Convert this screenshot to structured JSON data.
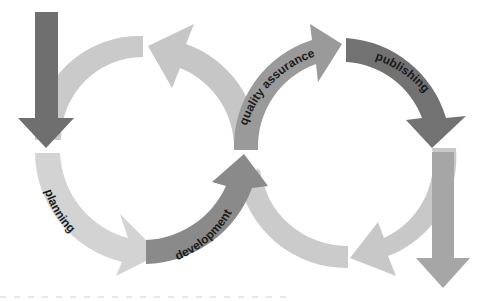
{
  "diagram": {
    "type": "cyclical process flow (figure-eight / infinity loop of arrows)",
    "colors": {
      "dark": "#707070",
      "medium": "#8c8c8c",
      "light": "#c9c9c9",
      "lighter": "#d4d4d4",
      "text": "#1a1a1a",
      "background": "#ffffff"
    },
    "stages": [
      {
        "id": "planning",
        "label": "planning"
      },
      {
        "id": "development",
        "label": "development"
      },
      {
        "id": "quality_assurance",
        "label": "quality assurance"
      },
      {
        "id": "publishing",
        "label": "publishing"
      }
    ]
  }
}
